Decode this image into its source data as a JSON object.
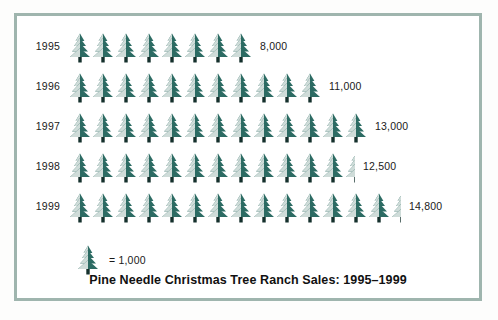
{
  "chart_data": {
    "type": "bar",
    "subtype": "pictograph",
    "title": "Pine Needle Christmas Tree Ranch Sales: 1995–1999",
    "xlabel": "",
    "ylabel": "",
    "categories": [
      "1995",
      "1996",
      "1997",
      "1998",
      "1999"
    ],
    "values": [
      8000,
      11000,
      13000,
      12500,
      14800
    ],
    "value_labels": [
      "8,000",
      "11,000",
      "13,000",
      "12,500",
      "14,800"
    ],
    "icon_counts": [
      8,
      11,
      13,
      12.5,
      14.8
    ],
    "icon_unit_value": 1000,
    "icon_name": "christmas-tree-icon",
    "legend": {
      "icon_name": "christmas-tree-icon",
      "text": "= 1,000"
    },
    "grid": false,
    "legend_position": "bottom-left",
    "colors": {
      "icon_dark": "#2c6b63",
      "icon_light": "#cfdcd9",
      "trunk": "#14302c",
      "border": "#9fb5ae",
      "background": "#ffffff",
      "text": "#1a1a1a"
    }
  },
  "rows": [
    {
      "year": "1995",
      "value_label": "8,000",
      "full_trees": 8,
      "half_tree": false,
      "partial": false
    },
    {
      "year": "1996",
      "value_label": "11,000",
      "full_trees": 11,
      "half_tree": false,
      "partial": false
    },
    {
      "year": "1997",
      "value_label": "13,000",
      "full_trees": 13,
      "half_tree": false,
      "partial": false
    },
    {
      "year": "1998",
      "value_label": "12,500",
      "full_trees": 12,
      "half_tree": true,
      "partial": false
    },
    {
      "year": "1999",
      "value_label": "14,800",
      "full_trees": 14,
      "half_tree": false,
      "partial": true
    }
  ]
}
